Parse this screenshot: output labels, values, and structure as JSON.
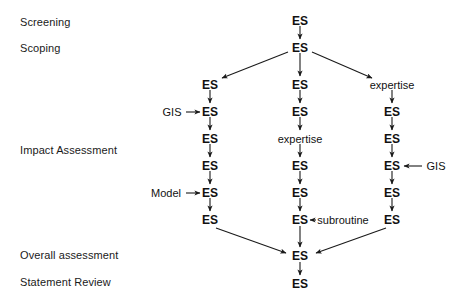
{
  "diagram": {
    "stage_labels": [
      {
        "id": "screening",
        "text": "Screening",
        "x": 20,
        "y": 22
      },
      {
        "id": "scoping",
        "text": "Scoping",
        "x": 20,
        "y": 48
      },
      {
        "id": "impact-assessment",
        "text": "Impact Assessment",
        "x": 20,
        "y": 150
      },
      {
        "id": "overall-assessment",
        "text": "Overall assessment",
        "x": 20,
        "y": 255
      },
      {
        "id": "statement-review",
        "text": "Statement Review",
        "x": 20,
        "y": 282
      }
    ],
    "nodes": [
      {
        "id": "top-es-1",
        "text": "ES",
        "x": 300,
        "y": 21,
        "kind": "es"
      },
      {
        "id": "top-es-2",
        "text": "ES",
        "x": 300,
        "y": 48,
        "kind": "es"
      },
      {
        "id": "left-es-1",
        "text": "ES",
        "x": 210,
        "y": 85,
        "kind": "es"
      },
      {
        "id": "left-es-2",
        "text": "ES",
        "x": 210,
        "y": 112,
        "kind": "es"
      },
      {
        "id": "left-es-3",
        "text": "ES",
        "x": 210,
        "y": 139,
        "kind": "es"
      },
      {
        "id": "left-es-4",
        "text": "ES",
        "x": 210,
        "y": 166,
        "kind": "es"
      },
      {
        "id": "left-es-5",
        "text": "ES",
        "x": 210,
        "y": 193,
        "kind": "es"
      },
      {
        "id": "left-es-6",
        "text": "ES",
        "x": 210,
        "y": 220,
        "kind": "es"
      },
      {
        "id": "mid-es-1",
        "text": "ES",
        "x": 300,
        "y": 85,
        "kind": "es"
      },
      {
        "id": "mid-es-2",
        "text": "ES",
        "x": 300,
        "y": 112,
        "kind": "es"
      },
      {
        "id": "mid-expertise",
        "text": "expertise",
        "x": 300,
        "y": 139,
        "kind": "aux"
      },
      {
        "id": "mid-es-3",
        "text": "ES",
        "x": 300,
        "y": 166,
        "kind": "es"
      },
      {
        "id": "mid-es-4",
        "text": "ES",
        "x": 300,
        "y": 193,
        "kind": "es"
      },
      {
        "id": "mid-es-5",
        "text": "ES",
        "x": 300,
        "y": 220,
        "kind": "es"
      },
      {
        "id": "right-expertise",
        "text": "expertise",
        "x": 392,
        "y": 85,
        "kind": "aux"
      },
      {
        "id": "right-es-1",
        "text": "ES",
        "x": 392,
        "y": 112,
        "kind": "es"
      },
      {
        "id": "right-es-2",
        "text": "ES",
        "x": 392,
        "y": 139,
        "kind": "es"
      },
      {
        "id": "right-es-3",
        "text": "ES",
        "x": 392,
        "y": 166,
        "kind": "es"
      },
      {
        "id": "right-es-4",
        "text": "ES",
        "x": 392,
        "y": 193,
        "kind": "es"
      },
      {
        "id": "right-es-5",
        "text": "ES",
        "x": 392,
        "y": 220,
        "kind": "es"
      },
      {
        "id": "bottom-es-1",
        "text": "ES",
        "x": 300,
        "y": 256,
        "kind": "es"
      },
      {
        "id": "bottom-es-2",
        "text": "ES",
        "x": 300,
        "y": 284,
        "kind": "es"
      }
    ],
    "side_inputs": [
      {
        "id": "gis-left",
        "text": "GIS",
        "x": 172,
        "y": 112,
        "direction": "right"
      },
      {
        "id": "model-left",
        "text": "Model",
        "x": 166,
        "y": 193,
        "direction": "right"
      },
      {
        "id": "gis-right",
        "text": "GIS",
        "x": 436,
        "y": 166,
        "direction": "left"
      },
      {
        "id": "subroutine",
        "text": "subroutine",
        "x": 343,
        "y": 220,
        "direction": "left"
      }
    ],
    "colors": {
      "ink": "#1a1a1a",
      "background": "#ffffff"
    }
  }
}
